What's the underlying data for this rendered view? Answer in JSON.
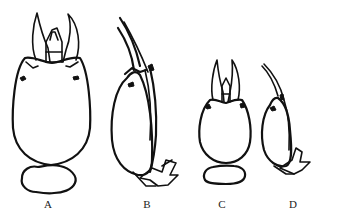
{
  "figure": {
    "panels": [
      {
        "label": "A",
        "view": "dorsal",
        "size": "large"
      },
      {
        "label": "B",
        "view": "lateral",
        "size": "large"
      },
      {
        "label": "C",
        "view": "dorsal",
        "size": "small"
      },
      {
        "label": "D",
        "view": "lateral",
        "size": "small"
      }
    ]
  },
  "colors": {
    "line": "#111111",
    "background": "#ffffff"
  }
}
